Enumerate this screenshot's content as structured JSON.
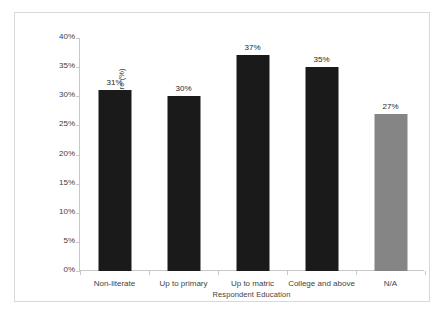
{
  "chart_data": {
    "type": "bar",
    "title": "",
    "xlabel": "Respondent Education",
    "ylabel": "Vote Share (%)",
    "categories": [
      "Non-literate",
      "Up to primary",
      "Up to matric",
      "College and above",
      "N/A"
    ],
    "values": [
      31,
      30,
      37,
      35,
      27
    ],
    "data_labels": [
      "31%",
      "30%",
      "37%",
      "35%",
      "27%"
    ],
    "bar_colors": [
      "#1a1a1a",
      "#1a1a1a",
      "#1a1a1a",
      "#1a1a1a",
      "#858585"
    ],
    "ylim": [
      0,
      40
    ],
    "ytick_values": [
      0,
      5,
      10,
      15,
      20,
      25,
      30,
      35,
      40
    ],
    "ytick_labels": [
      "0%",
      "5%",
      "10%",
      "15%",
      "20%",
      "25%",
      "30%",
      "35%",
      "40%"
    ],
    "grid": false,
    "legend": null,
    "axis_color": "#c8c8c8",
    "frame_color": "#d9d9d9",
    "background": "#ffffff"
  }
}
